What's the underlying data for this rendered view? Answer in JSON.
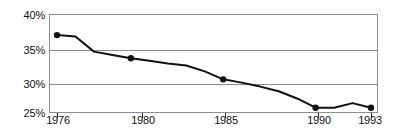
{
  "chart_data": {
    "type": "line",
    "title": "",
    "subtitle": "",
    "xlabel": "",
    "ylabel": "",
    "x": [
      1976,
      1977,
      1978,
      1979,
      1980,
      1981,
      1982,
      1983,
      1984,
      1985,
      1986,
      1987,
      1988,
      1989,
      1990,
      1991,
      1992,
      1993
    ],
    "values": [
      36.8,
      36.6,
      34.3,
      33.8,
      33.3,
      32.9,
      32.5,
      32.2,
      31.3,
      30.1,
      29.6,
      29.0,
      28.3,
      27.2,
      25.8,
      25.8,
      26.5,
      25.8
    ],
    "series": [
      {
        "name": "series-1",
        "values": [
          36.8,
          36.6,
          34.3,
          33.8,
          33.3,
          32.9,
          32.5,
          32.2,
          31.3,
          30.1,
          29.6,
          29.0,
          28.3,
          27.2,
          25.8,
          25.8,
          26.5,
          25.8
        ]
      }
    ],
    "markers": [
      {
        "x": 1976,
        "y": 36.8
      },
      {
        "x": 1980,
        "y": 33.3
      },
      {
        "x": 1985,
        "y": 30.1
      },
      {
        "x": 1990,
        "y": 25.8
      },
      {
        "x": 1993,
        "y": 25.8
      }
    ],
    "xlim": [
      1976,
      1993
    ],
    "ylim": [
      25,
      40
    ],
    "xticks": [
      1976,
      1980,
      1985,
      1990,
      1993
    ],
    "xtick_labels": [
      "1976",
      "1980",
      "1985",
      "1990",
      "1993"
    ],
    "yticks": [
      25,
      30,
      35,
      40
    ],
    "ytick_labels": [
      "25%",
      "30%",
      "35%",
      "40%"
    ],
    "grid": "horizontal",
    "legend": "none",
    "line_color": "#111111",
    "grid_color": "#8c8c8c",
    "marker_color": "#111111",
    "background": "#ffffff"
  },
  "axes": {
    "y_labels": [
      {
        "text": "40%"
      },
      {
        "text": "35%"
      },
      {
        "text": "30%"
      },
      {
        "text": "25%"
      }
    ],
    "x_labels": [
      {
        "text": "1976"
      },
      {
        "text": "1980"
      },
      {
        "text": "1985"
      },
      {
        "text": "1990"
      },
      {
        "text": "1993"
      }
    ]
  }
}
